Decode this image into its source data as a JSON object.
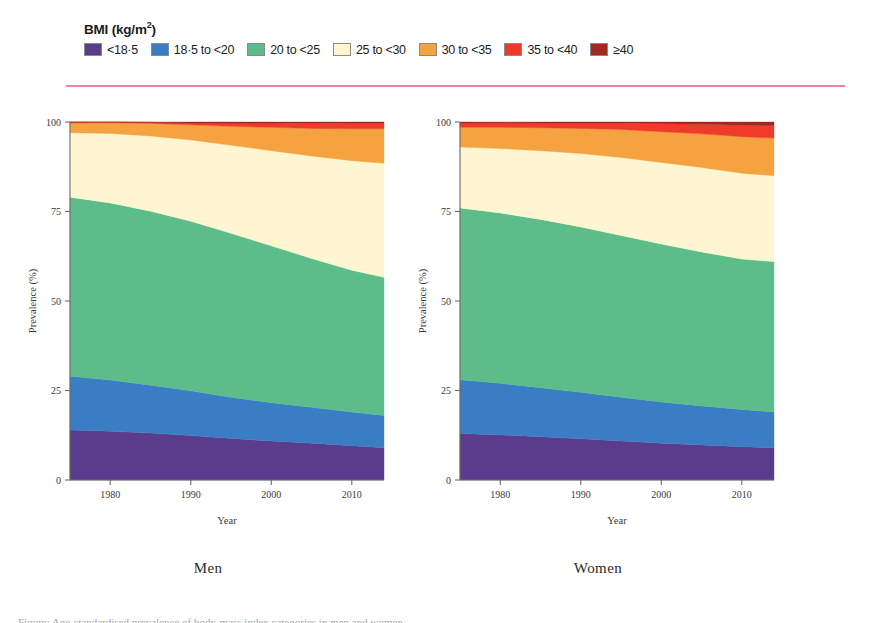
{
  "legend": {
    "title_main": "BMI (kg/m",
    "title_sup": "2",
    "title_close": ")",
    "items": [
      {
        "label": "<18·5",
        "color": "#5b3b8c"
      },
      {
        "label": "18·5 to <20",
        "color": "#3b7dc4"
      },
      {
        "label": "20 to <25",
        "color": "#5cbd8a"
      },
      {
        "label": "25 to <30",
        "color": "#fdf6d0"
      },
      {
        "label": "30 to <35",
        "color": "#f5a241"
      },
      {
        "label": "35 to <40",
        "color": "#f03b2a"
      },
      {
        "label": "≥40",
        "color": "#9e2a22"
      }
    ],
    "rule_color": "#e8889f"
  },
  "panels": [
    {
      "caption": "Men"
    },
    {
      "caption": "Women"
    }
  ],
  "chart_data": [
    {
      "type": "area",
      "title": "Men",
      "stacked": true,
      "xlabel": "Year",
      "ylabel": "Prevalence (%)",
      "xlim": [
        1975,
        2014
      ],
      "ylim": [
        0,
        100
      ],
      "xticks": [
        1980,
        1990,
        2000,
        2010
      ],
      "yticks": [
        0,
        25,
        50,
        75,
        100
      ],
      "xticklabels": [
        "1980",
        "1990",
        "2000",
        "2010"
      ],
      "yticklabels": [
        "0",
        "25",
        "50",
        "75",
        "100"
      ],
      "grid": false,
      "legend_position": "above-figure",
      "x": [
        1975,
        1980,
        1985,
        1990,
        1995,
        2000,
        2005,
        2010,
        2014
      ],
      "series": [
        {
          "name": "<18·5",
          "color": "#5b3b8c",
          "values": [
            14.0,
            13.6,
            13.1,
            12.4,
            11.6,
            10.9,
            10.3,
            9.6,
            9.0
          ]
        },
        {
          "name": "18·5 to <20",
          "color": "#3b7dc4",
          "values": [
            15.0,
            14.3,
            13.4,
            12.5,
            11.5,
            10.7,
            10.0,
            9.4,
            9.0
          ]
        },
        {
          "name": "20 to <25",
          "color": "#5cbd8a",
          "values": [
            50.0,
            49.5,
            48.6,
            47.4,
            45.8,
            43.8,
            41.6,
            39.6,
            38.6
          ]
        },
        {
          "name": "25 to <30",
          "color": "#fdf6d0",
          "values": [
            18.0,
            19.4,
            21.0,
            22.7,
            24.6,
            26.6,
            28.6,
            30.6,
            31.9
          ]
        },
        {
          "name": "30 to <35",
          "color": "#f5a241",
          "values": [
            2.7,
            3.0,
            3.5,
            4.2,
            5.3,
            6.5,
            7.7,
            8.9,
            9.6
          ]
        },
        {
          "name": "35 to <40",
          "color": "#f03b2a",
          "values": [
            0.3,
            0.2,
            0.3,
            0.5,
            0.9,
            1.2,
            1.4,
            1.6,
            1.6
          ]
        },
        {
          "name": "≥40",
          "color": "#9e2a22",
          "values": [
            0.0,
            0.0,
            0.1,
            0.3,
            0.3,
            0.3,
            0.4,
            0.3,
            0.3
          ]
        }
      ]
    },
    {
      "type": "area",
      "title": "Women",
      "stacked": true,
      "xlabel": "Year",
      "ylabel": "Prevalence (%)",
      "xlim": [
        1975,
        2014
      ],
      "ylim": [
        0,
        100
      ],
      "xticks": [
        1980,
        1990,
        2000,
        2010
      ],
      "yticks": [
        0,
        25,
        50,
        75,
        100
      ],
      "xticklabels": [
        "1980",
        "1990",
        "2000",
        "2010"
      ],
      "yticklabels": [
        "0",
        "25",
        "50",
        "75",
        "100"
      ],
      "grid": false,
      "legend_position": "above-figure",
      "x": [
        1975,
        1980,
        1985,
        1990,
        1995,
        2000,
        2005,
        2010,
        2014
      ],
      "series": [
        {
          "name": "<18·5",
          "color": "#5b3b8c",
          "values": [
            13.0,
            12.6,
            12.1,
            11.5,
            10.9,
            10.3,
            9.8,
            9.3,
            9.0
          ]
        },
        {
          "name": "18·5 to <20",
          "color": "#3b7dc4",
          "values": [
            15.0,
            14.4,
            13.7,
            13.0,
            12.2,
            11.5,
            10.9,
            10.4,
            10.0
          ]
        },
        {
          "name": "20 to <25",
          "color": "#5cbd8a",
          "values": [
            48.0,
            47.6,
            47.0,
            46.2,
            45.2,
            44.1,
            43.0,
            42.0,
            42.0
          ]
        },
        {
          "name": "25 to <30",
          "color": "#fdf6d0",
          "values": [
            17.0,
            18.0,
            19.2,
            20.5,
            21.8,
            22.8,
            23.6,
            24.0,
            24.0
          ]
        },
        {
          "name": "30 to <35",
          "color": "#f5a241",
          "values": [
            5.5,
            5.9,
            6.4,
            7.0,
            7.8,
            8.6,
            9.4,
            10.2,
            10.5
          ]
        },
        {
          "name": "35 to <40",
          "color": "#f03b2a",
          "values": [
            1.2,
            1.3,
            1.3,
            1.5,
            1.8,
            2.2,
            2.7,
            3.2,
            3.5
          ]
        },
        {
          "name": "≥40",
          "color": "#9e2a22",
          "values": [
            0.3,
            0.2,
            0.3,
            0.3,
            0.3,
            0.5,
            0.6,
            0.9,
            1.0
          ]
        }
      ]
    }
  ],
  "bottom_caption_sliver": "Figure: Age-standardised prevalence of body-mass index categories in men and women"
}
